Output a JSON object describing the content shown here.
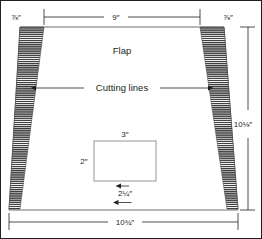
{
  "diagram": {
    "colors": {
      "outline": "#6d6e71",
      "frame": "#231f20",
      "hatch": "#3b3b3b",
      "dimension_line": "#231f20",
      "inner_rect_stroke": "#939598",
      "background": "#ffffff"
    },
    "labels": {
      "flap": "Flap",
      "cutting_lines": "Cutting lines"
    },
    "dimensions": {
      "top_width": {
        "value": "9",
        "unit": "″",
        "display": "9″",
        "position": "top-center"
      },
      "top_left_margin": {
        "whole": "",
        "numerator": "7",
        "denominator": "8",
        "unit": "″",
        "display": "⅞″",
        "position": "top-left"
      },
      "top_right_margin": {
        "whole": "",
        "numerator": "7",
        "denominator": "8",
        "unit": "″",
        "display": "⅞″",
        "position": "top-right"
      },
      "height": {
        "whole": "10",
        "numerator": "1",
        "denominator": "8",
        "unit": "″",
        "display": "10⅛″",
        "position": "right"
      },
      "bottom_width": {
        "whole": "10",
        "numerator": "3",
        "denominator": "4",
        "unit": "″",
        "display": "10¾″",
        "position": "bottom-center"
      },
      "inner_width": {
        "value": "3",
        "unit": "″",
        "display": "3″",
        "position": "inner-top"
      },
      "inner_height": {
        "value": "2",
        "unit": "″",
        "display": "2″",
        "position": "inner-left"
      },
      "inner_bottom_offset": {
        "whole": "2",
        "numerator": "1",
        "denominator": "4",
        "unit": "″",
        "display": "2¼″",
        "position": "inner-bottom"
      }
    }
  }
}
